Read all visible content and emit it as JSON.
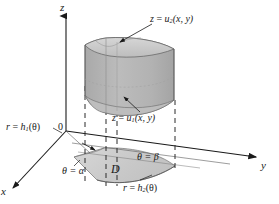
{
  "figure": {
    "background_color": "#ffffff",
    "ink_color": "#1a1a1a"
  },
  "axes": {
    "z_label": "z",
    "y_label": "y",
    "x_label": "x",
    "origin_label": "0"
  },
  "labels": {
    "upper_surface": {
      "lhs": "z",
      "eq": " = ",
      "fn": "u",
      "sub": "2",
      "args": "(x, y)"
    },
    "lower_surface": {
      "lhs": "z",
      "eq": " = ",
      "fn": "u",
      "sub": "1",
      "args": "(x, y)"
    },
    "inner_radius": {
      "lhs": "r",
      "eq": " = ",
      "fn": "h",
      "sub": "1",
      "args": "(θ)"
    },
    "outer_radius": {
      "lhs": "r",
      "eq": " = ",
      "fn": "h",
      "sub": "2",
      "args": "(θ)"
    },
    "theta_start": "θ = α",
    "theta_end": "θ = β",
    "region": "D"
  },
  "colors": {
    "solid_front": "#b6b6b6",
    "solid_side": "#a8a8a8",
    "solid_top": "#c6c6c6",
    "solid_top_highlight": "#d2d2d2",
    "solid_bottom_inner": "#c0c0c0",
    "region_fill": "#c9c9c9",
    "region_fill_light": "#d4d4d4",
    "stroke": "#1a1a1a",
    "faint_stroke": "#8a8a8a",
    "dashed_stroke": "#3a3a3a"
  },
  "geometry": {
    "origin_px": [
      66,
      131
    ],
    "z_axis_top_px": [
      66,
      12
    ],
    "y_axis_end_px": [
      262,
      158
    ],
    "x_axis_end_px": [
      8,
      192
    ]
  }
}
